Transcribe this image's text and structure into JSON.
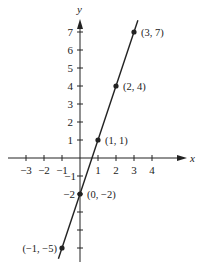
{
  "chart_data": {
    "type": "line",
    "title": "",
    "xlabel": "x",
    "ylabel": "y",
    "xlim": [
      -3.5,
      5.7
    ],
    "ylim": [
      -5.6,
      7.6
    ],
    "x_ticks": [
      -3,
      -2,
      -1,
      1,
      2,
      3,
      4
    ],
    "x_tick_labels": [
      "−3",
      "−2",
      "−1",
      "1",
      "2",
      "3",
      "4"
    ],
    "y_ticks": [
      -2,
      -1,
      1,
      2,
      3,
      4,
      5,
      6,
      7
    ],
    "y_tick_labels": [
      "−2",
      "−1",
      "1",
      "2",
      "3",
      "4",
      "5",
      "6",
      "7"
    ],
    "grid": false,
    "equation": "y = 3x - 2",
    "series": [
      {
        "name": "y = 3x - 2",
        "x": [
          -1,
          0,
          1,
          2,
          3
        ],
        "y": [
          -5,
          -2,
          1,
          4,
          7
        ],
        "point_labels": [
          "(−1, −5)",
          "(0, −2)",
          "(1, 1)",
          "(2, 4)",
          "(3, 7)"
        ]
      }
    ],
    "color": "#222222"
  }
}
